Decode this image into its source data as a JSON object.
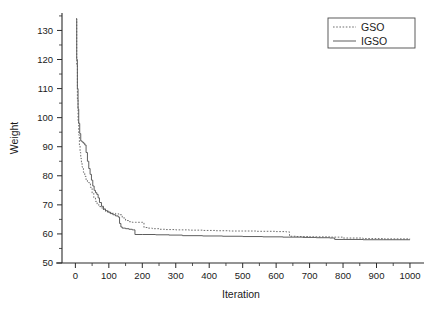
{
  "chart_data": {
    "type": "line",
    "title": "",
    "xlabel": "Iteration",
    "ylabel": "Weight",
    "xlim": [
      -40,
      1030
    ],
    "ylim": [
      50,
      136
    ],
    "xticks": [
      0,
      100,
      200,
      300,
      400,
      500,
      600,
      700,
      800,
      900,
      1000
    ],
    "xticklabels": [
      "0",
      "100",
      "200",
      "300",
      "400",
      "500",
      "600",
      "700",
      "800",
      "900",
      "1000"
    ],
    "yticks": [
      50,
      60,
      70,
      80,
      90,
      100,
      110,
      120,
      130
    ],
    "yticklabels": [
      "50",
      "60",
      "70",
      "80",
      "90",
      "100",
      "110",
      "120",
      "130"
    ],
    "grid": false,
    "legend_position": "top-right",
    "series": [
      {
        "name": "GSO",
        "style": "dotted",
        "color": "#666666",
        "x": [
          2,
          4,
          6,
          8,
          10,
          12,
          14,
          16,
          18,
          20,
          24,
          28,
          32,
          36,
          40,
          45,
          50,
          55,
          60,
          65,
          70,
          80,
          90,
          100,
          110,
          120,
          130,
          140,
          150,
          160,
          170,
          175,
          180,
          190,
          200,
          205,
          215,
          230,
          250,
          270,
          300,
          340,
          380,
          420,
          460,
          500,
          540,
          570,
          600,
          630,
          640,
          660,
          700,
          760,
          800,
          860,
          920,
          1000
        ],
        "y": [
          134.0,
          118.0,
          106.0,
          99.0,
          94.0,
          90.5,
          88.0,
          86.0,
          84.5,
          83.0,
          81.2,
          79.8,
          78.6,
          78.0,
          77.6,
          76.0,
          74.0,
          72.5,
          71.2,
          70.2,
          69.4,
          68.4,
          67.8,
          67.4,
          67.1,
          66.9,
          66.6,
          65.5,
          64.6,
          64.2,
          64.0,
          64.0,
          64.0,
          64.0,
          64.0,
          62.2,
          62.0,
          61.8,
          61.6,
          61.5,
          61.4,
          61.3,
          61.2,
          61.1,
          61.0,
          61.0,
          60.9,
          60.9,
          60.8,
          60.7,
          59.2,
          59.1,
          59.0,
          58.9,
          58.6,
          58.4,
          58.3,
          58.2
        ]
      },
      {
        "name": "IGSO",
        "style": "solid",
        "color": "#555555",
        "x": [
          2,
          4,
          6,
          8,
          10,
          13,
          16,
          20,
          24,
          28,
          32,
          36,
          40,
          44,
          48,
          52,
          56,
          60,
          64,
          68,
          72,
          78,
          84,
          90,
          96,
          104,
          112,
          120,
          128,
          132,
          136,
          140,
          150,
          160,
          170,
          174,
          178,
          200,
          240,
          280,
          320,
          380,
          440,
          500,
          560,
          620,
          680,
          720,
          760,
          768,
          775,
          800,
          860,
          920,
          1000
        ],
        "y": [
          134.0,
          120.0,
          110.0,
          103.0,
          98.0,
          94.5,
          92.0,
          91.6,
          91.2,
          90.6,
          88.0,
          85.0,
          82.5,
          80.5,
          78.5,
          76.5,
          75.0,
          74.2,
          73.6,
          72.4,
          70.8,
          69.5,
          68.6,
          68.0,
          67.5,
          67.0,
          66.6,
          66.2,
          65.8,
          63.6,
          62.4,
          62.0,
          61.8,
          61.6,
          61.4,
          61.4,
          59.8,
          59.8,
          59.7,
          59.6,
          59.4,
          59.3,
          59.2,
          59.1,
          59.0,
          58.9,
          58.8,
          58.7,
          58.6,
          58.6,
          58.1,
          58.1,
          58.0,
          58.0,
          58.0
        ]
      }
    ]
  },
  "legend": {
    "entries": [
      {
        "label": "GSO"
      },
      {
        "label": "IGSO"
      }
    ]
  }
}
